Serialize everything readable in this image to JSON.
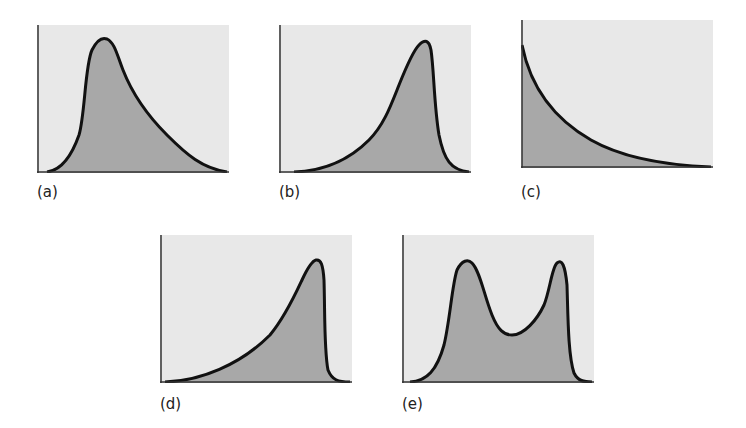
{
  "figure": {
    "background": "#ffffff",
    "panel_background": "#e8e8e8",
    "fill_color": "#a8a8a8",
    "curve_color": "#111111",
    "axis_color": "#333333"
  },
  "panels": [
    {
      "id": "a",
      "label": "(a)",
      "shape": "right-skewed unimodal (positive skew)"
    },
    {
      "id": "b",
      "label": "(b)",
      "shape": "left-skewed unimodal (negative skew)"
    },
    {
      "id": "c",
      "label": "(c)",
      "shape": "exponential decay (J-shaped, reverse)"
    },
    {
      "id": "d",
      "label": "(d)",
      "shape": "strongly left-skewed unimodal"
    },
    {
      "id": "e",
      "label": "(e)",
      "shape": "bimodal"
    }
  ]
}
